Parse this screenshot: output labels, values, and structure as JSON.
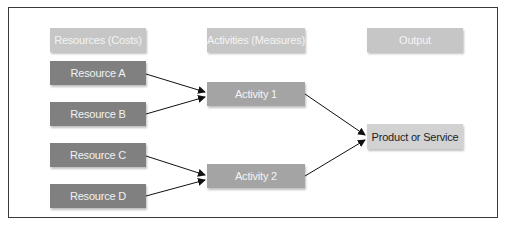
{
  "diagram": {
    "headers": {
      "resources": "Resources (Costs)",
      "activities": "Activities (Measures)",
      "output": "Output"
    },
    "resources": [
      "Resource A",
      "Resource B",
      "Resource C",
      "Resource D"
    ],
    "activities": [
      "Activity 1",
      "Activity 2"
    ],
    "output": "Product or Service",
    "edges": [
      {
        "from": "Resource A",
        "to": "Activity 1"
      },
      {
        "from": "Resource B",
        "to": "Activity 1"
      },
      {
        "from": "Resource C",
        "to": "Activity 2"
      },
      {
        "from": "Resource D",
        "to": "Activity 2"
      },
      {
        "from": "Activity 1",
        "to": "Product or Service"
      },
      {
        "from": "Activity 2",
        "to": "Product or Service"
      }
    ],
    "colors": {
      "header_fill": "#c6c6c6",
      "resource_fill": "#808080",
      "activity_fill": "#a4a4a4",
      "output_fill": "#d2d2d2",
      "border": "#3a3a3a"
    }
  }
}
